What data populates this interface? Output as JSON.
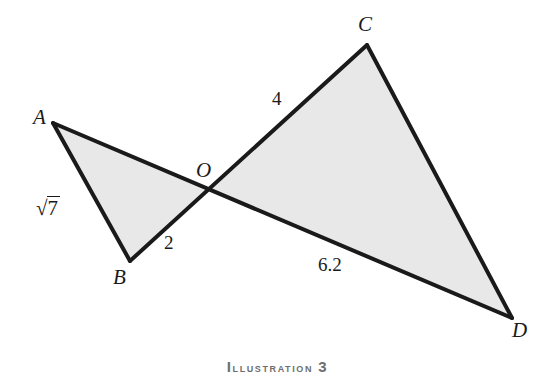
{
  "figure": {
    "caption_lead": "I",
    "caption_rest": "llustration",
    "caption_number": "3",
    "background_color": "#ffffff",
    "stroke_color": "#1a1a1a",
    "fill_color": "#e8e8e8"
  },
  "diagram": {
    "type": "geometry",
    "vertices": [
      {
        "name": "A",
        "label": "A",
        "x": 53,
        "y": 123
      },
      {
        "name": "B",
        "label": "B",
        "x": 130,
        "y": 261
      },
      {
        "name": "O",
        "label": "O",
        "x": 207,
        "y": 191
      },
      {
        "name": "C",
        "label": "C",
        "x": 367,
        "y": 45
      },
      {
        "name": "D",
        "label": "D",
        "x": 512,
        "y": 318
      }
    ],
    "vertex_label_positions": [
      {
        "name": "A",
        "label": "A",
        "x": 33,
        "y": 107
      },
      {
        "name": "B",
        "label": "B",
        "x": 113,
        "y": 267
      },
      {
        "name": "O",
        "label": "O",
        "x": 196,
        "y": 160
      },
      {
        "name": "C",
        "label": "C",
        "x": 358,
        "y": 14
      },
      {
        "name": "D",
        "label": "D",
        "x": 512,
        "y": 320
      }
    ],
    "triangles": [
      {
        "name": "triangle-AOB",
        "points": "53,123 207,191 130,261"
      },
      {
        "name": "triangle-COD",
        "points": "207,191 367,45 512,318"
      }
    ],
    "segments": [
      {
        "name": "segment-AD",
        "x1": 53,
        "y1": 123,
        "x2": 512,
        "y2": 318
      },
      {
        "name": "segment-BC",
        "x1": 130,
        "y1": 261,
        "x2": 367,
        "y2": 45
      },
      {
        "name": "segment-AB",
        "x1": 53,
        "y1": 123,
        "x2": 130,
        "y2": 261
      },
      {
        "name": "segment-CD",
        "x1": 367,
        "y1": 45,
        "x2": 512,
        "y2": 318
      }
    ],
    "measures": [
      {
        "name": "measure-AB",
        "side": "AB",
        "value": "√7",
        "radical": true,
        "radicand": "7",
        "x": 36,
        "y": 196
      },
      {
        "name": "measure-BO",
        "side": "BO",
        "value": "2",
        "radical": false,
        "x": 164,
        "y": 233
      },
      {
        "name": "measure-OC",
        "side": "OC",
        "value": "4",
        "radical": false,
        "x": 272,
        "y": 89
      },
      {
        "name": "measure-OD",
        "side": "OD",
        "value": "6.2",
        "radical": false,
        "x": 318,
        "y": 255
      }
    ]
  }
}
